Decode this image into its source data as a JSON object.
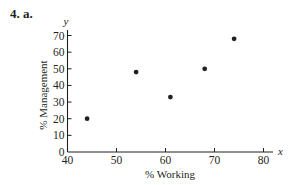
{
  "problem_label": "4. a.",
  "chart_data": {
    "type": "scatter",
    "title": "",
    "xlabel": "% Working",
    "ylabel": "% Management",
    "x_axis_var": "x",
    "y_axis_var": "y",
    "xlim": [
      40,
      80
    ],
    "ylim": [
      0,
      70
    ],
    "xticks": [
      40,
      50,
      60,
      70,
      80
    ],
    "yticks": [
      0,
      10,
      20,
      30,
      40,
      50,
      60,
      70
    ],
    "grid": false,
    "legend": null,
    "points": [
      {
        "x": 44,
        "y": 20
      },
      {
        "x": 54,
        "y": 48
      },
      {
        "x": 61,
        "y": 33
      },
      {
        "x": 68,
        "y": 50
      },
      {
        "x": 74,
        "y": 68
      }
    ],
    "point_color": "#231f20"
  }
}
